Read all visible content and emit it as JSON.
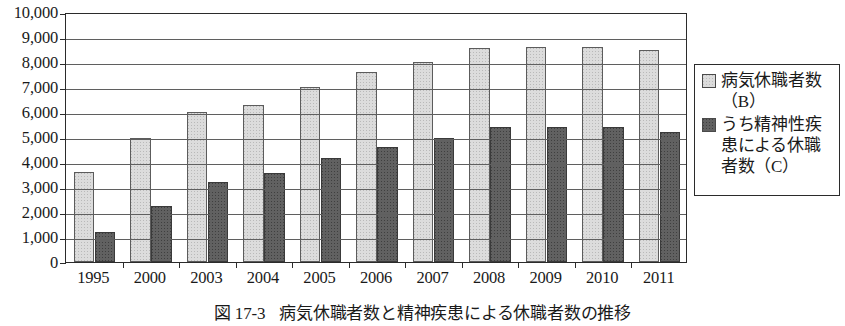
{
  "chart_data": {
    "type": "bar",
    "title": "",
    "caption_number": "図 17-3",
    "caption_text": "病気休職者数と精神疾患による休職者数の推移",
    "xlabel": "",
    "ylabel": "",
    "ylim": [
      0,
      10000
    ],
    "ytick_step": 1000,
    "grid": true,
    "legend_position": "right",
    "categories": [
      "1995",
      "2000",
      "2003",
      "2004",
      "2005",
      "2006",
      "2007",
      "2008",
      "2009",
      "2010",
      "2011"
    ],
    "ytick_labels": [
      "10,000",
      "9,000",
      "8,000",
      "7,000",
      "6,000",
      "5,000",
      "4,000",
      "3,000",
      "2,000",
      "1,000",
      "0"
    ],
    "series": [
      {
        "name": "病気休職者数（B）",
        "color": "#dcdcdc",
        "values": [
          3600,
          4950,
          6000,
          6300,
          7000,
          7600,
          8000,
          8550,
          8600,
          8600,
          8500
        ]
      },
      {
        "name": "うち精神性疾患による休職者数（C）",
        "color": "#616161",
        "values": [
          1200,
          2250,
          3200,
          3550,
          4150,
          4600,
          4950,
          5400,
          5400,
          5400,
          5200
        ]
      }
    ]
  },
  "legend": {
    "entries": [
      {
        "label": "病気休職者数（B）",
        "swatch": "light-gray-swatch"
      },
      {
        "label": "うち精神性疾患による休職者数（C）",
        "swatch": "dark-gray-swatch"
      }
    ]
  },
  "colors": {
    "bar_light": "#dcdcdc",
    "bar_dark": "#616161",
    "axis": "#2b2b2b",
    "gridline": "#5f5f5f",
    "background": "#ffffff"
  }
}
